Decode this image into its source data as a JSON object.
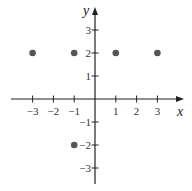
{
  "chart_data": {
    "type": "scatter",
    "title": "",
    "xlabel": "x",
    "ylabel": "y",
    "xlim": [
      -3.5,
      3.6
    ],
    "ylim": [
      -3.6,
      3.5
    ],
    "grid": false,
    "legend": null,
    "x_ticks": [
      -3,
      -2,
      -1,
      1,
      2,
      3
    ],
    "y_ticks": [
      3,
      2,
      1,
      -1,
      -2,
      -3
    ],
    "x_tick_labels": [
      "−3",
      "−2",
      "−1",
      "1",
      "2",
      "3"
    ],
    "y_tick_labels": [
      "3",
      "2",
      "1",
      "−1",
      "−2",
      "−3"
    ],
    "points": [
      {
        "x": -3,
        "y": 2
      },
      {
        "x": -1,
        "y": 2
      },
      {
        "x": 1,
        "y": 2
      },
      {
        "x": 3,
        "y": 2
      },
      {
        "x": -1,
        "y": -2
      }
    ],
    "point_color": "#555555",
    "axis_color": "#222222"
  }
}
